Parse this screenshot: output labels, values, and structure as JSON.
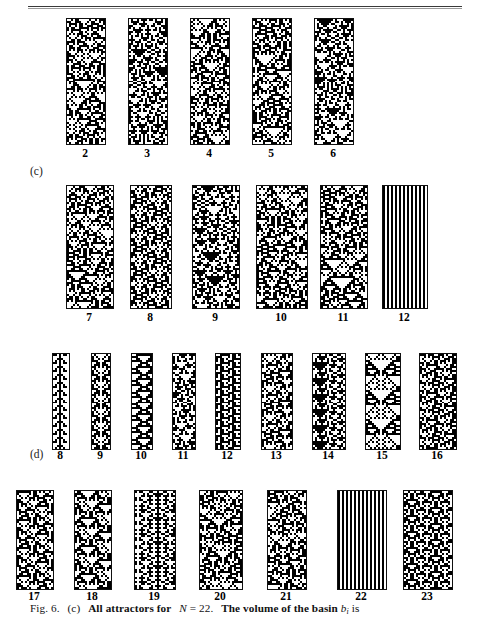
{
  "figure": {
    "caption_prefix": "Fig. 6.",
    "caption_part": "(c)",
    "caption_text_1": "All attractors for",
    "caption_math_N": "N",
    "caption_eq": "= 22.",
    "caption_text_2": "The volume of the basin",
    "caption_math_b": "b",
    "caption_math_b_sub": "i",
    "caption_text_3": "is"
  },
  "panels": [
    {
      "name": "panel-c",
      "label": "(c)",
      "label_x": 30,
      "label_y": 165,
      "rows": [
        {
          "name": "row-c-1",
          "top": 18,
          "height": 125,
          "label_y": 147,
          "items": [
            {
              "label": "2",
              "x": 66,
              "w": 38,
              "period": 2,
              "seed": 2
            },
            {
              "label": "3",
              "x": 128,
              "w": 38,
              "period": 3,
              "seed": 3
            },
            {
              "label": "4",
              "x": 190,
              "w": 38,
              "period": 4,
              "seed": 4
            },
            {
              "label": "5",
              "x": 252,
              "w": 38,
              "period": 5,
              "seed": 5
            },
            {
              "label": "6",
              "x": 314,
              "w": 38,
              "period": 6,
              "seed": 6
            }
          ]
        },
        {
          "name": "row-c-2",
          "top": 185,
          "height": 122,
          "label_y": 311,
          "items": [
            {
              "label": "7",
              "x": 66,
              "w": 46,
              "period": 7,
              "seed": 7
            },
            {
              "label": "8",
              "x": 130,
              "w": 40,
              "period": 8,
              "seed": 8
            },
            {
              "label": "9",
              "x": 192,
              "w": 46,
              "period": 9,
              "seed": 9
            },
            {
              "label": "10",
              "x": 256,
              "w": 50,
              "period": 10,
              "seed": 10
            },
            {
              "label": "11",
              "x": 320,
              "w": 46,
              "period": 11,
              "seed": 11
            },
            {
              "label": "12",
              "x": 382,
              "w": 44,
              "period": 1,
              "seed": 12,
              "style": "stripes"
            }
          ]
        }
      ]
    },
    {
      "name": "panel-d",
      "label": "(d)",
      "label_x": 30,
      "label_y": 448,
      "rows": [
        {
          "name": "row-d-1",
          "top": 353,
          "height": 95,
          "label_y": 449,
          "items": [
            {
              "label": "8",
              "x": 52,
              "w": 16,
              "period": 8,
              "seed": 108
            },
            {
              "label": "9",
              "x": 91,
              "w": 18,
              "period": 9,
              "seed": 109
            },
            {
              "label": "10",
              "x": 131,
              "w": 20,
              "period": 10,
              "seed": 110
            },
            {
              "label": "11",
              "x": 172,
              "w": 22,
              "period": 11,
              "seed": 111
            },
            {
              "label": "12",
              "x": 215,
              "w": 24,
              "period": 12,
              "seed": 112
            },
            {
              "label": "13",
              "x": 261,
              "w": 30,
              "period": 13,
              "seed": 113
            },
            {
              "label": "14",
              "x": 312,
              "w": 32,
              "period": 14,
              "seed": 114
            },
            {
              "label": "15",
              "x": 365,
              "w": 34,
              "period": 15,
              "seed": 115
            },
            {
              "label": "16",
              "x": 419,
              "w": 36,
              "period": 16,
              "seed": 116
            }
          ]
        },
        {
          "name": "row-d-2",
          "top": 490,
          "height": 98,
          "label_y": 590,
          "items": [
            {
              "label": "17",
              "x": 16,
              "w": 36,
              "period": 17,
              "seed": 217
            },
            {
              "label": "18",
              "x": 74,
              "w": 36,
              "period": 18,
              "seed": 218
            },
            {
              "label": "19",
              "x": 134,
              "w": 40,
              "period": 19,
              "seed": 219
            },
            {
              "label": "20",
              "x": 199,
              "w": 42,
              "period": 20,
              "seed": 220
            },
            {
              "label": "21",
              "x": 267,
              "w": 38,
              "period": 21,
              "seed": 221
            },
            {
              "label": "22",
              "x": 337,
              "w": 48,
              "period": 22,
              "seed": 222
            },
            {
              "label": "23",
              "x": 403,
              "w": 48,
              "period": 23,
              "seed": 223
            }
          ]
        }
      ]
    }
  ],
  "render": {
    "cell_px": 2,
    "ink": "#000000",
    "paper": "#ffffff",
    "border": "#111111"
  }
}
